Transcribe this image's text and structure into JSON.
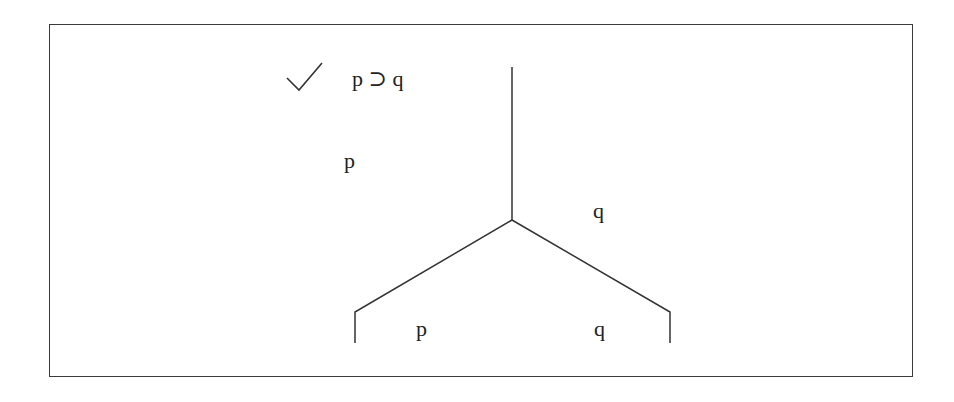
{
  "tree": {
    "check_mark": "checked",
    "premises": [
      {
        "text": "p ⊃ q",
        "checked": true
      },
      {
        "text": "p"
      }
    ],
    "trunk_formula": "q",
    "branches": [
      {
        "side": "left",
        "leaf": "p"
      },
      {
        "side": "right",
        "leaf": "q"
      }
    ]
  },
  "colors": {
    "ink": "#222222",
    "frame": "#3a3a3a",
    "background": "#ffffff"
  }
}
